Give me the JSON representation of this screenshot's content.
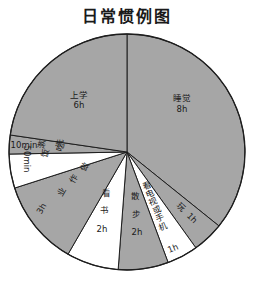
{
  "title": "日常惯例图",
  "chart_data": {
    "type": "pie",
    "title": "日常惯例图",
    "start_angle": "12 o'clock",
    "direction": "clockwise",
    "slices": [
      {
        "label": "睡觉",
        "value_text": "8h",
        "hours": 8,
        "fill": "#a6a6a6"
      },
      {
        "label": "玩",
        "value_text": "1h",
        "hours": 1,
        "fill": "#a6a6a6"
      },
      {
        "label": "看电视或手机",
        "value_text": "1h",
        "hours": 1,
        "fill": "#ffffff"
      },
      {
        "label": "散步",
        "value_text": "2h",
        "hours": 2,
        "fill": "#a6a6a6"
      },
      {
        "label": "看书",
        "value_text": "2h",
        "hours": 2,
        "fill": "#ffffff"
      },
      {
        "label": "做作业",
        "value_text": "3h",
        "hours": 3,
        "fill": "#a6a6a6"
      },
      {
        "label": "吃饭",
        "value_text": "50min",
        "hours": 0.833,
        "fill": "#ffffff"
      },
      {
        "label": "洗漱",
        "value_text": "10min",
        "hours": 0.167,
        "fill": "#a6a6a6"
      },
      {
        "label": "上学",
        "value_text": "6h",
        "hours": 6,
        "fill": "#a6a6a6"
      }
    ],
    "legend": "none",
    "colors": {
      "gray": "#a6a6a6",
      "white": "#ffffff",
      "stroke": "#1e1e1e"
    }
  }
}
